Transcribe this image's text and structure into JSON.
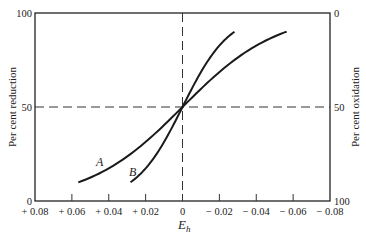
{
  "chart_data": {
    "type": "line",
    "title": "",
    "xlabel": "E",
    "xlabel_subscript": "h",
    "ylabel_left": "Per cent reduction",
    "ylabel_right": "Per cent oxidation",
    "xlim": [
      0.08,
      -0.08
    ],
    "ylim": [
      0,
      100
    ],
    "x_ticks": [
      0.08,
      0.06,
      0.04,
      0.02,
      0,
      -0.02,
      -0.04,
      -0.06,
      -0.08
    ],
    "x_tick_labels": [
      "+ 0.08",
      "+ 0.06",
      "+ 0.04",
      "+ 0.02",
      "0",
      "− 0.02",
      "− 0.04",
      "− 0.06",
      "− 0.08"
    ],
    "y_ticks_left": [
      0,
      50,
      100
    ],
    "y_tick_labels_left": [
      "0",
      "50",
      "100"
    ],
    "y_ticks_right": [
      0,
      50,
      100
    ],
    "y_tick_labels_right": [
      "100",
      "50",
      "0"
    ],
    "reference_lines": {
      "horizontal_dashed_at_y": 50,
      "vertical_dashed_at_x": 0
    },
    "grid": false,
    "series": [
      {
        "name": "A",
        "n_electrons": 1,
        "x_range": [
          0.0565,
          -0.0565
        ],
        "points": [
          {
            "x": 0.0565,
            "y": 10
          },
          {
            "x": 0.04,
            "y": 17.4
          },
          {
            "x": 0.02,
            "y": 31.5
          },
          {
            "x": 0,
            "y": 50
          },
          {
            "x": -0.02,
            "y": 68.5
          },
          {
            "x": -0.04,
            "y": 82.6
          },
          {
            "x": -0.0565,
            "y": 90
          }
        ]
      },
      {
        "name": "B",
        "n_electrons": 2,
        "x_range": [
          0.0282,
          -0.0282
        ],
        "points": [
          {
            "x": 0.0282,
            "y": 10
          },
          {
            "x": 0.02,
            "y": 17.4
          },
          {
            "x": 0.01,
            "y": 31.5
          },
          {
            "x": 0,
            "y": 50
          },
          {
            "x": -0.01,
            "y": 68.5
          },
          {
            "x": -0.02,
            "y": 82.6
          },
          {
            "x": -0.0282,
            "y": 90
          }
        ]
      }
    ],
    "annotations": [
      {
        "text": "A",
        "series": "A"
      },
      {
        "text": "B",
        "series": "B"
      }
    ]
  }
}
